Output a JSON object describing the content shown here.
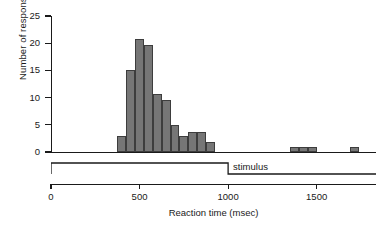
{
  "chart_data": {
    "type": "bar",
    "title": "",
    "xlabel": "Reaction time (msec)",
    "ylabel": "Number of responses",
    "xlim": [
      0,
      1835
    ],
    "ylim": [
      0,
      25
    ],
    "xticks": [
      0,
      500,
      1000,
      1500
    ],
    "xtick_labels": [
      "0",
      "500",
      "1000",
      "1500"
    ],
    "yticks": [
      0,
      5,
      10,
      15,
      20,
      25
    ],
    "ytick_labels": [
      "0",
      "5",
      "10",
      "15",
      "20",
      "25"
    ],
    "grid": false,
    "legend": null,
    "bin_width": 50,
    "bar_color": "#767676",
    "bar_edge_color": "#3d3d3d",
    "axis_color": "#1a1a1a",
    "bins": [
      {
        "x0": 375,
        "x1": 425,
        "value": 3
      },
      {
        "x0": 425,
        "x1": 475,
        "value": 15
      },
      {
        "x0": 475,
        "x1": 525,
        "value": 20.7
      },
      {
        "x0": 525,
        "x1": 575,
        "value": 19.6
      },
      {
        "x0": 575,
        "x1": 625,
        "value": 10.6
      },
      {
        "x0": 625,
        "x1": 675,
        "value": 9.6
      },
      {
        "x0": 675,
        "x1": 725,
        "value": 5
      },
      {
        "x0": 725,
        "x1": 775,
        "value": 2.9
      },
      {
        "x0": 775,
        "x1": 825,
        "value": 3.6
      },
      {
        "x0": 825,
        "x1": 875,
        "value": 3.6
      },
      {
        "x0": 875,
        "x1": 925,
        "value": 1.9
      },
      {
        "x0": 1350,
        "x1": 1400,
        "value": 1
      },
      {
        "x0": 1400,
        "x1": 1450,
        "value": 1
      },
      {
        "x0": 1450,
        "x1": 1500,
        "value": 1
      },
      {
        "x0": 1690,
        "x1": 1740,
        "value": 1
      }
    ],
    "annotations": [
      {
        "name": "stimulus-trace",
        "label": "stimulus",
        "onset": 0,
        "offset": 1000,
        "shape": "square-pulse"
      }
    ]
  }
}
